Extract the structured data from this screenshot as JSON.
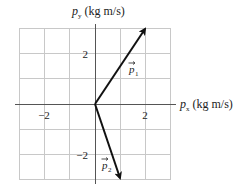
{
  "diagram": {
    "y_axis": {
      "symbol": "p",
      "subscript": "y",
      "unit": "(kg m/s)"
    },
    "x_axis": {
      "symbol": "p",
      "subscript": "x",
      "unit": "(kg m/s)"
    },
    "x_ticks": [
      {
        "value": -2,
        "label": "−2"
      },
      {
        "value": 2,
        "label": "2"
      }
    ],
    "y_ticks": [
      {
        "value": 2,
        "label": "2"
      },
      {
        "value": -2,
        "label": "−2"
      }
    ],
    "grid": {
      "min": -3,
      "max": 3,
      "step": 1
    },
    "vectors": [
      {
        "name": "p1",
        "label_symbol": "p",
        "label_subscript": "1",
        "x": 2,
        "y": 3
      },
      {
        "name": "p2",
        "label_symbol": "p",
        "label_subscript": "2",
        "x": 1,
        "y": -3
      }
    ],
    "colors": {
      "grid": "#c8c8c8",
      "axis": "#555555",
      "vector": "#111111",
      "text": "#222222"
    }
  }
}
